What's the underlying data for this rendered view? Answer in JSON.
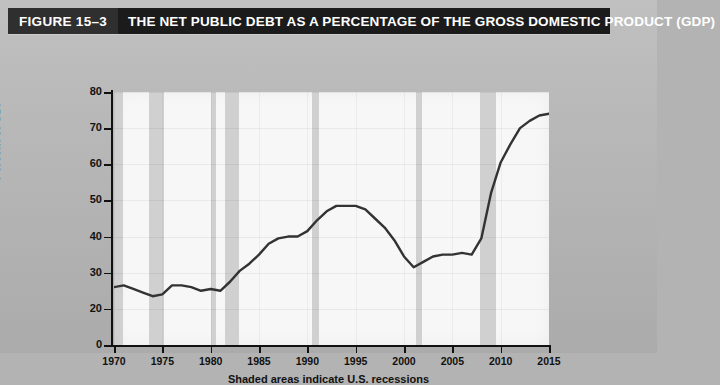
{
  "header": {
    "figure_tag": "FIGURE 15–3",
    "title": "THE NET PUBLIC DEBT AS A PERCENTAGE OF THE GROSS DOMESTIC PRODUCT (GDP)",
    "tag_bg": "#2f2f2f",
    "bar_bg": "#1b1b1b",
    "text_color": "#ffffff"
  },
  "chart_data": {
    "type": "line",
    "title": "THE NET PUBLIC DEBT AS A PERCENTAGE OF THE GROSS DOMESTIC PRODUCT (GDP)",
    "xlabel": "",
    "ylabel": "Percent of GDP",
    "caption": "Shaded areas indicate U.S. recessions",
    "grid": true,
    "legend": "none",
    "line_color": "#333333",
    "plot_bg": "#f7f7f7",
    "band_color": "#c9c9c9",
    "xlim": [
      1970,
      2015
    ],
    "ylim": [
      0,
      80
    ],
    "y_ticks": [
      0,
      20,
      30,
      40,
      50,
      60,
      70,
      80
    ],
    "y_tick_labels": [
      "0",
      "20",
      "30",
      "40",
      "50",
      "60",
      "70",
      "80"
    ],
    "y_axis_note": "broken axis: no tick between 0 and 20",
    "x_ticks": [
      1970,
      1975,
      1980,
      1985,
      1990,
      1995,
      2000,
      2005,
      2010,
      2015
    ],
    "x_tick_labels": [
      "1970",
      "1975",
      "1980",
      "1985",
      "1990",
      "1995",
      "2000",
      "2005",
      "2010",
      "2015"
    ],
    "recession_bands": [
      {
        "start": 1969.9,
        "end": 1970.9
      },
      {
        "start": 1973.6,
        "end": 1975.2
      },
      {
        "start": 1980.0,
        "end": 1980.6
      },
      {
        "start": 1981.5,
        "end": 1982.9
      },
      {
        "start": 1990.5,
        "end": 1991.2
      },
      {
        "start": 2001.2,
        "end": 2001.9
      },
      {
        "start": 2007.9,
        "end": 2009.5
      }
    ],
    "x": [
      1970,
      1971,
      1972,
      1973,
      1974,
      1975,
      1976,
      1977,
      1978,
      1979,
      1980,
      1981,
      1982,
      1983,
      1984,
      1985,
      1986,
      1987,
      1988,
      1989,
      1990,
      1991,
      1992,
      1993,
      1994,
      1995,
      1996,
      1997,
      1998,
      1999,
      2000,
      2001,
      2002,
      2003,
      2004,
      2005,
      2006,
      2007,
      2008,
      2009,
      2010,
      2011,
      2012,
      2013,
      2014,
      2015
    ],
    "values": [
      26.0,
      26.5,
      25.5,
      24.5,
      23.5,
      24.0,
      26.5,
      26.5,
      26.0,
      25.0,
      25.5,
      25.0,
      27.5,
      30.5,
      32.5,
      35.0,
      38.0,
      39.5,
      40.0,
      40.0,
      41.5,
      44.5,
      47.0,
      48.5,
      48.5,
      48.5,
      47.5,
      45.0,
      42.5,
      39.0,
      34.5,
      31.5,
      33.0,
      34.5,
      35.0,
      35.0,
      35.5,
      35.0,
      39.5,
      52.0,
      60.5,
      65.5,
      70.0,
      72.0,
      73.5,
      74.0
    ],
    "series_name": "Net public debt as percent of GDP"
  }
}
